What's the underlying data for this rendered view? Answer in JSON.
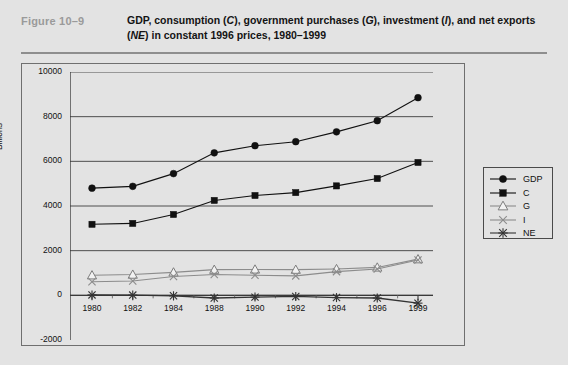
{
  "figure": {
    "number": "Figure  10–9",
    "title_html": "GDP, consumption (<i>C</i>), government purchases (<i>G</i>), investment (<i>I</i>), and net exports (<i>NE</i>) in constant 1996 prices, 1980–1999"
  },
  "chart_data": {
    "type": "line",
    "xlabel": "",
    "ylabel": "Billions",
    "categories": [
      "1980",
      "1982",
      "1984",
      "1988",
      "1990",
      "1992",
      "1994",
      "1996",
      "1999"
    ],
    "x_tick_labels": [
      "1980",
      "1982",
      "1984",
      "1988",
      "1990",
      "1992",
      "1994",
      "1996",
      "1999"
    ],
    "y_tick_labels": [
      "10000",
      "8000",
      "6000",
      "4000",
      "2000",
      "0",
      "-2000"
    ],
    "y_ticks": [
      10000,
      8000,
      6000,
      4000,
      2000,
      0,
      -2000
    ],
    "ylim": [
      -2000,
      10000
    ],
    "grid": "horizontal",
    "legend_position": "right-outside",
    "series": [
      {
        "name": "GDP",
        "marker": "filled-circle",
        "color": "#111111",
        "values": [
          4800,
          4880,
          5450,
          6380,
          6700,
          6880,
          7320,
          7820,
          8850
        ]
      },
      {
        "name": "C",
        "marker": "filled-square",
        "color": "#111111",
        "values": [
          3180,
          3220,
          3620,
          4250,
          4470,
          4600,
          4900,
          5230,
          5950
        ]
      },
      {
        "name": "G",
        "marker": "open-triangle",
        "color": "#8c8c8c",
        "values": [
          900,
          930,
          1030,
          1150,
          1160,
          1150,
          1180,
          1250,
          1620
        ]
      },
      {
        "name": "I",
        "marker": "cross-x",
        "color": "#8c8c8c",
        "values": [
          610,
          640,
          840,
          930,
          900,
          870,
          1060,
          1180,
          1580
        ]
      },
      {
        "name": "NE",
        "marker": "asterisk",
        "color": "#333333",
        "values": [
          20,
          10,
          -20,
          -120,
          -80,
          -50,
          -100,
          -120,
          -350
        ]
      }
    ]
  },
  "legend": {
    "items": [
      {
        "label": "GDP",
        "marker": "filled-circle"
      },
      {
        "label": "C",
        "marker": "filled-square"
      },
      {
        "label": "G",
        "marker": "open-triangle"
      },
      {
        "label": "I",
        "marker": "cross-x"
      },
      {
        "label": "NE",
        "marker": "asterisk"
      }
    ]
  }
}
